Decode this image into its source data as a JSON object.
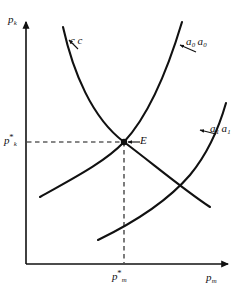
{
  "figure": {
    "kind": "economic-equilibrium-diagram",
    "background_color": "#ffffff",
    "line_color": "#111111"
  },
  "axes": {
    "y": {
      "name": "p",
      "subscript": "k",
      "arrow": true,
      "origin_px": [
        26,
        264
      ],
      "top_px": [
        26,
        18
      ]
    },
    "x": {
      "name": "p",
      "subscript": "m",
      "arrow": true,
      "origin_px": [
        26,
        264
      ],
      "right_px": [
        232,
        264
      ]
    }
  },
  "ticks": {
    "y_star": {
      "name": "p",
      "superscript": "*",
      "subscript": "k",
      "value_px": 142
    },
    "x_star": {
      "name": "p",
      "superscript": "*",
      "subscript": "m",
      "value_px": 124
    }
  },
  "equilibrium": {
    "label": "E",
    "marker": "filled-dot",
    "point_px": [
      124,
      142
    ],
    "leader_arrow": "left"
  },
  "guides": {
    "style": "dashed",
    "horizontal": {
      "from_px": [
        26,
        142
      ],
      "to_px": [
        124,
        142
      ]
    },
    "vertical": {
      "from_px": [
        124,
        142
      ],
      "to_px": [
        124,
        264
      ]
    }
  },
  "curves": [
    {
      "id": "cc",
      "label_name": "c",
      "label_pair": "c",
      "label_subscript": "",
      "slope": "downward",
      "description": "cc schedule, downward sloping convex curve",
      "path": "M63,27 C73,72 92,118 124,142 C152,163 184,190 210,207",
      "leader": {
        "from_px": [
          78,
          48
        ],
        "to_px": [
          68,
          40
        ],
        "arrow": true
      }
    },
    {
      "id": "a0a0",
      "label_name": "a",
      "label_pair": "a",
      "label_subscript": "0",
      "slope": "upward",
      "description": "a0a0 schedule, upward sloping convex curve through equilibrium",
      "path": "M40,197 C70,180 104,163 124,142 C150,114 170,62 182,22",
      "leader": {
        "from_px": [
          195,
          51
        ],
        "to_px": [
          179,
          45
        ],
        "arrow": true
      }
    },
    {
      "id": "a1a1",
      "label_name": "a",
      "label_pair": "a",
      "label_subscript": "1",
      "slope": "upward",
      "description": "a1a1 schedule, upward sloping convex curve shifted right of a0a0",
      "path": "M98,240 C133,223 166,203 190,175 C209,152 220,124 226,103",
      "leader": {
        "from_px": [
          216,
          134
        ],
        "to_px": [
          199,
          130
        ],
        "arrow": true
      }
    }
  ]
}
